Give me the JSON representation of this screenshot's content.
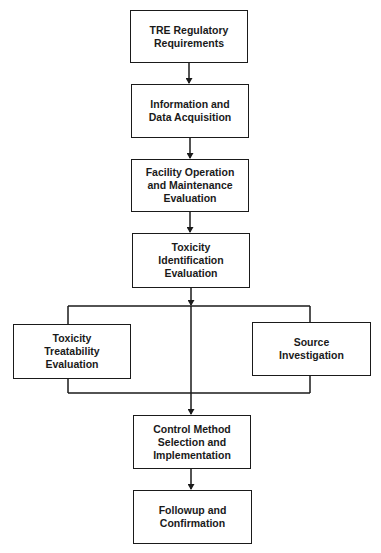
{
  "diagram": {
    "type": "flowchart",
    "colors": {
      "line": "#1a1a1a",
      "background": "#ffffff"
    },
    "nodes": [
      {
        "id": "n1",
        "lines": [
          "TRE Regulatory",
          "Requirements"
        ]
      },
      {
        "id": "n2",
        "lines": [
          "Information and",
          "Data Acquisition"
        ]
      },
      {
        "id": "n3",
        "lines": [
          "Facility Operation",
          "and Maintenance",
          "Evaluation"
        ]
      },
      {
        "id": "n4",
        "lines": [
          "Toxicity",
          "Identification",
          "Evaluation"
        ]
      },
      {
        "id": "n5",
        "lines": [
          "Toxicity",
          "Treatability",
          "Evaluation"
        ]
      },
      {
        "id": "n6",
        "lines": [
          "Source",
          "Investigation"
        ]
      },
      {
        "id": "n7",
        "lines": [
          "Control Method",
          "Selection and",
          "Implementation"
        ]
      },
      {
        "id": "n8",
        "lines": [
          "Followup and",
          "Confirmation"
        ]
      }
    ],
    "edges": [
      {
        "from": "n1",
        "to": "n2",
        "arrow": true
      },
      {
        "from": "n2",
        "to": "n3",
        "arrow": true
      },
      {
        "from": "n3",
        "to": "n4",
        "arrow": true
      },
      {
        "from": "n4",
        "to": "n5",
        "arrow": false,
        "note": "via branch bus"
      },
      {
        "from": "n4",
        "to": "n6",
        "arrow": false,
        "note": "via branch bus"
      },
      {
        "from": "n4",
        "to": "n7",
        "arrow": true,
        "note": "direct center line"
      },
      {
        "from": "n5",
        "to": "n7",
        "arrow": false,
        "note": "via merge bus"
      },
      {
        "from": "n6",
        "to": "n7",
        "arrow": false,
        "note": "via merge bus"
      },
      {
        "from": "n7",
        "to": "n8",
        "arrow": true
      }
    ]
  }
}
